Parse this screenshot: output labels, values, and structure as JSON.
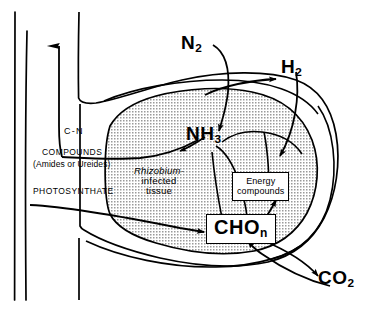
{
  "figure": {
    "background_color": "#ffffff",
    "ink_color": "#000000",
    "stipple_fill": "#bdbdbd"
  },
  "labels": {
    "n2": "N",
    "n2_sub": "2",
    "h2": "H",
    "h2_sub": "2",
    "nh3": "NH",
    "nh3_sub": "3",
    "co2": "CO",
    "co2_sub": "2",
    "cn": "C-N",
    "compounds": "COMPOUNDS",
    "amides_or_ureides": "(Amides or Ureides)",
    "photosynthate": "PHOTOSYNTHATE"
  },
  "tissue_label": {
    "genus": "Rhizobium-",
    "line2": "infected",
    "line3": "tissue"
  },
  "boxes": {
    "energy_compounds": {
      "line1": "Energy",
      "line2": "compounds"
    },
    "cho_n": {
      "text": "CHO",
      "subscript": "n"
    }
  }
}
